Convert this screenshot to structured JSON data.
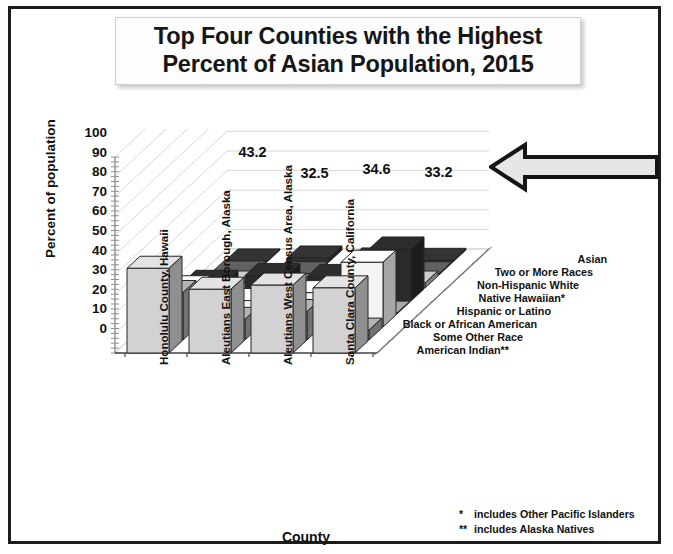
{
  "title": {
    "line1": "Top Four Counties with the Highest",
    "line2": "Percent of Asian Population, 2015"
  },
  "axes": {
    "ylabel": "Percent of population",
    "xlabel": "County",
    "yticks": [
      "100",
      "90",
      "80",
      "70",
      "60",
      "50",
      "40",
      "30",
      "20",
      "10",
      "0"
    ]
  },
  "footnotes": [
    {
      "mark": "*",
      "text": "includes Other Pacific Islanders"
    },
    {
      "mark": "**",
      "text": "includes Alaska Natives"
    }
  ],
  "arrow": {
    "direction": "left",
    "fill": "#e6e6e6",
    "stroke": "#151515"
  },
  "chart_data": {
    "type": "bar",
    "title": "Top Four Counties with the Highest Percent of Asian Population, 2015",
    "xlabel": "County",
    "ylabel": "Percent of population",
    "ylim": [
      0,
      100
    ],
    "grid": true,
    "legend_position": "depth-axis-right",
    "projection": "3d-clustered",
    "categories": [
      "Honolulu County, Hawaii",
      "Aleutians East Borough, Alaska",
      "Aleutians West Census Area, Alaska",
      "Santa Clara County, California"
    ],
    "series": [
      {
        "name": "Asian",
        "values": [
          43.2,
          32.5,
          34.6,
          33.2
        ],
        "color": "#d2d2d2",
        "labeled": true
      },
      {
        "name": "Two or More Races",
        "values": [
          24.2,
          10.5,
          14.5,
          5.0
        ],
        "color": "#a8a8a8",
        "labeled": false
      },
      {
        "name": "Non-Hispanic White",
        "values": [
          20.0,
          13.5,
          17.5,
          33.0
        ],
        "color": "#f4f4f4",
        "labeled": false
      },
      {
        "name": "Native Hawaiian*",
        "values": [
          9.5,
          2.0,
          2.0,
          0.4
        ],
        "color": "#9c9c9c",
        "labeled": false
      },
      {
        "name": "Hispanic or Latino",
        "values": [
          9.5,
          13.0,
          12.5,
          26.5
        ],
        "color": "#2a2a2a",
        "labeled": false
      },
      {
        "name": "Black or African American",
        "values": [
          2.5,
          1.0,
          1.5,
          2.5
        ],
        "color": "#bdbdbd",
        "labeled": false
      },
      {
        "name": "Some Other Race",
        "values": [
          1.0,
          0.6,
          1.0,
          0.6
        ],
        "color": "#5a5a5a",
        "labeled": false
      },
      {
        "name": "American Indian**",
        "values": [
          0.5,
          2.0,
          1.0,
          0.8
        ],
        "color": "#303030",
        "labeled": false
      }
    ],
    "data_labels": [
      "43.2",
      "32.5",
      "34.6",
      "33.2"
    ]
  }
}
